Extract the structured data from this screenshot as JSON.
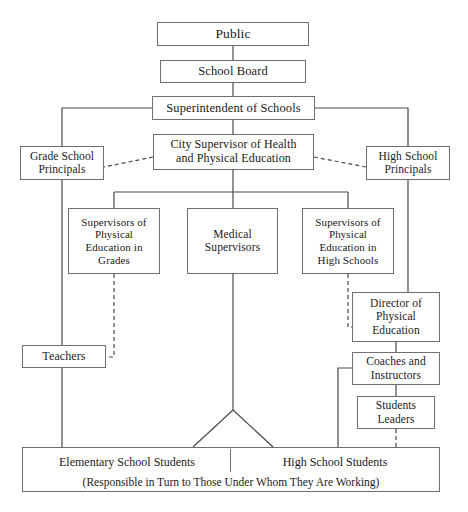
{
  "diagram": {
    "type": "organizational-chart",
    "background_color": "#ffffff",
    "line_color": "#4a4a4a",
    "border_color": "#6f6f6f",
    "text_color": "#1a1a1a",
    "nodes": [
      {
        "id": "public",
        "label": "Public",
        "x": 157,
        "y": 22,
        "w": 152,
        "h": 24,
        "font_size": 13.5
      },
      {
        "id": "school-board",
        "label": "School Board",
        "x": 160,
        "y": 60,
        "w": 146,
        "h": 23,
        "font_size": 12.5
      },
      {
        "id": "superintendent",
        "label": "Superintendent of Schools",
        "x": 152,
        "y": 96,
        "w": 163,
        "h": 24,
        "font_size": 12.5
      },
      {
        "id": "city-supervisor",
        "label": "City Supervisor of Health\nand Physical Education",
        "x": 153,
        "y": 134,
        "w": 161,
        "h": 36,
        "font_size": 12
      },
      {
        "id": "grade-school-principals",
        "label": "Grade School\nPrincipals",
        "x": 20,
        "y": 146,
        "w": 84,
        "h": 34,
        "font_size": 11.5
      },
      {
        "id": "high-school-principals",
        "label": "High School\nPrincipals",
        "x": 366,
        "y": 146,
        "w": 84,
        "h": 34,
        "font_size": 11.5
      },
      {
        "id": "supervisors-pe-grades",
        "label": "Supervisors of\nPhysical\nEducation in\nGrades",
        "x": 68,
        "y": 208,
        "w": 92,
        "h": 66,
        "font_size": 11
      },
      {
        "id": "medical-supervisors",
        "label": "Medical\nSupervisors",
        "x": 187,
        "y": 208,
        "w": 91,
        "h": 66,
        "font_size": 11.5
      },
      {
        "id": "supervisors-pe-high-schools",
        "label": "Supervisors of\nPhysical\nEducation in\nHigh Schools",
        "x": 302,
        "y": 208,
        "w": 92,
        "h": 66,
        "font_size": 11
      },
      {
        "id": "director-pe",
        "label": "Director of\nPhysical\nEducation",
        "x": 352,
        "y": 292,
        "w": 88,
        "h": 50,
        "font_size": 11.5
      },
      {
        "id": "teachers",
        "label": "Teachers",
        "x": 22,
        "y": 345,
        "w": 84,
        "h": 23,
        "font_size": 12
      },
      {
        "id": "coaches-instructors",
        "label": "Coaches and\nInstructors",
        "x": 352,
        "y": 352,
        "w": 88,
        "h": 33,
        "font_size": 11.5
      },
      {
        "id": "students-leaders",
        "label": "Students\nLeaders",
        "x": 357,
        "y": 396,
        "w": 78,
        "h": 33,
        "font_size": 11.5
      }
    ],
    "bottom_box": {
      "id": "students-bottom",
      "x": 22,
      "y": 447,
      "w": 418,
      "h": 45,
      "divider_x": 229,
      "left_label": "Elementary School Students",
      "right_label": "High School Students",
      "caption": "(Responsible in Turn to Those Under Whom They Are Working)",
      "label_font_size": 12,
      "caption_font_size": 11.5
    },
    "edges": [
      {
        "id": "public-to-school-board",
        "style": "solid",
        "points": "233,46 233,60"
      },
      {
        "id": "school-board-to-superintendent",
        "style": "solid",
        "points": "233,83 233,96"
      },
      {
        "id": "superintendent-to-city-supervisor",
        "style": "solid",
        "points": "233,120 233,134"
      },
      {
        "id": "superintendent-to-left-rail",
        "style": "solid",
        "points": "152,108 62,108 62,146"
      },
      {
        "id": "superintendent-to-right-rail",
        "style": "solid",
        "points": "315,108 408,108 408,146"
      },
      {
        "id": "left-rail-through-principals",
        "style": "solid",
        "points": "62,180 62,345"
      },
      {
        "id": "right-rail-through-principals",
        "style": "solid",
        "points": "408,180 408,292"
      },
      {
        "id": "city-supervisor-to-grade-principals",
        "style": "dashed",
        "points": "153,157 104,167"
      },
      {
        "id": "city-supervisor-to-high-principals",
        "style": "dashed",
        "points": "314,157 366,167"
      },
      {
        "id": "city-supervisor-to-bus",
        "style": "solid",
        "points": "233,170 233,192"
      },
      {
        "id": "bus-horizontal",
        "style": "solid",
        "points": "114,192 348,192"
      },
      {
        "id": "bus-to-supervisors-grades",
        "style": "solid",
        "points": "114,192 114,208"
      },
      {
        "id": "bus-to-medical",
        "style": "solid",
        "points": "233,192 233,208"
      },
      {
        "id": "bus-to-supervisors-high",
        "style": "solid",
        "points": "348,192 348,208"
      },
      {
        "id": "supervisors-grades-to-teachers",
        "style": "dashed",
        "points": "114,274 114,357 106,357"
      },
      {
        "id": "supervisors-high-to-director",
        "style": "dashed",
        "points": "348,274 348,327 352,327"
      },
      {
        "id": "director-to-coaches",
        "style": "solid",
        "points": "396,342 396,352"
      },
      {
        "id": "coaches-to-students-leaders",
        "style": "solid",
        "points": "396,385 396,396"
      },
      {
        "id": "right-rail-to-director-top",
        "style": "solid",
        "points": "408,292 408,292"
      },
      {
        "id": "coaches-branch-to-bottom",
        "style": "solid",
        "points": "352,368 338,368 338,447"
      },
      {
        "id": "students-leaders-to-bottom",
        "style": "dashed",
        "points": "396,429 396,447"
      },
      {
        "id": "teachers-to-bottom",
        "style": "solid",
        "points": "62,368 62,447"
      },
      {
        "id": "medical-to-split",
        "style": "solid",
        "points": "233,274 233,410"
      },
      {
        "id": "medical-split-left",
        "style": "solid",
        "points": "233,410 193,447"
      },
      {
        "id": "medical-split-right",
        "style": "solid",
        "points": "233,410 273,447"
      }
    ]
  }
}
